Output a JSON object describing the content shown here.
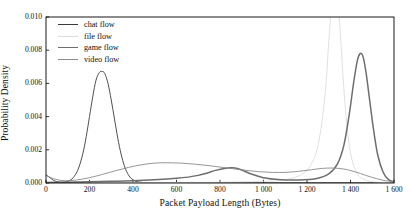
{
  "chart_data": {
    "type": "line",
    "title": "",
    "xlabel": "Packet Payload Length (Bytes)",
    "ylabel": "Probability Density",
    "xlim": [
      0,
      1600
    ],
    "ylim": [
      0.0,
      0.01
    ],
    "xticks": [
      "0",
      "200",
      "400",
      "600",
      "800",
      "1 000",
      "1 200",
      "1 400",
      "1 600"
    ],
    "xtick_values": [
      0,
      200,
      400,
      600,
      800,
      1000,
      1200,
      1400,
      1600
    ],
    "yticks": [
      "0.000",
      "0.002",
      "0.004",
      "0.006",
      "0.008",
      "0.010"
    ],
    "ytick_values": [
      0.0,
      0.002,
      0.004,
      0.006,
      0.008,
      0.01
    ],
    "grid": false,
    "legend_position": "upper left",
    "series": [
      {
        "name": "chat flow",
        "color": "#3b3b3b",
        "width": 0.9,
        "x": [
          0,
          10,
          20,
          35,
          50,
          70,
          90,
          110,
          130,
          150,
          170,
          185,
          200,
          215,
          230,
          245,
          258,
          270,
          285,
          300,
          315,
          330,
          345,
          360,
          375,
          390,
          410,
          430,
          460,
          500,
          560,
          640,
          760,
          900,
          1100,
          1300,
          1450,
          1600
        ],
        "y": [
          0.00048,
          0.0004,
          0.0003,
          0.00016,
          8e-05,
          4e-05,
          6e-05,
          0.00016,
          0.0004,
          0.0009,
          0.0018,
          0.0028,
          0.004,
          0.0052,
          0.0062,
          0.00665,
          0.00672,
          0.0066,
          0.006,
          0.005,
          0.00385,
          0.0027,
          0.00175,
          0.00105,
          0.00058,
          0.0003,
          0.00012,
          5e-05,
          2e-05,
          1e-05,
          1e-05,
          1e-05,
          1e-05,
          1e-05,
          1e-05,
          1e-05,
          1e-05,
          1e-05
        ]
      },
      {
        "name": "file flow",
        "color": "#dcdcdc",
        "width": 0.9,
        "x": [
          0,
          200,
          500,
          800,
          1000,
          1100,
          1180,
          1230,
          1260,
          1285,
          1300,
          1312,
          1322,
          1330,
          1338,
          1348,
          1360,
          1375,
          1395,
          1420,
          1450,
          1500,
          1560,
          1600
        ],
        "y": [
          2e-05,
          2e-05,
          3e-05,
          5e-05,
          0.0001,
          0.0002,
          0.00055,
          0.0014,
          0.0029,
          0.0056,
          0.0085,
          0.0106,
          0.0114,
          0.0116,
          0.0113,
          0.01,
          0.0076,
          0.0047,
          0.0022,
          0.00085,
          0.0003,
          8e-05,
          3e-05,
          2e-05
        ]
      },
      {
        "name": "game flow",
        "color": "#6e6e6e",
        "width": 1.5,
        "x": [
          0,
          60,
          150,
          300,
          450,
          600,
          700,
          780,
          820,
          850,
          870,
          900,
          940,
          1000,
          1080,
          1160,
          1240,
          1300,
          1340,
          1370,
          1395,
          1415,
          1432,
          1445,
          1458,
          1472,
          1488,
          1505,
          1525,
          1550,
          1575,
          1600
        ],
        "y": [
          3e-05,
          4e-05,
          6e-05,
          0.0001,
          0.00016,
          0.00028,
          0.00046,
          0.00076,
          0.00088,
          0.00092,
          0.0009,
          0.00078,
          0.00056,
          0.00032,
          0.0002,
          0.00018,
          0.00026,
          0.00055,
          0.00115,
          0.0023,
          0.0042,
          0.0061,
          0.0074,
          0.0078,
          0.0076,
          0.0066,
          0.005,
          0.0033,
          0.0017,
          0.00065,
          0.0002,
          8e-05
        ]
      },
      {
        "name": "video flow",
        "color": "#8a8a8a",
        "width": 0.9,
        "x": [
          0,
          20,
          50,
          90,
          140,
          200,
          260,
          320,
          380,
          440,
          500,
          560,
          620,
          680,
          740,
          800,
          860,
          920,
          980,
          1040,
          1100,
          1160,
          1220,
          1270,
          1320,
          1370,
          1420,
          1470,
          1520,
          1560,
          1600
        ],
        "y": [
          0.00046,
          0.00034,
          0.0002,
          0.00014,
          0.00018,
          0.00032,
          0.00052,
          0.00074,
          0.00094,
          0.0011,
          0.0012,
          0.00122,
          0.0012,
          0.00114,
          0.00106,
          0.00096,
          0.00086,
          0.00076,
          0.00068,
          0.00064,
          0.00064,
          0.0007,
          0.0008,
          0.00088,
          0.0009,
          0.00084,
          0.00068,
          0.00046,
          0.00026,
          0.00014,
          8e-05
        ]
      }
    ]
  },
  "legend": {
    "items": [
      {
        "label": "chat flow"
      },
      {
        "label": "file flow"
      },
      {
        "label": "game flow"
      },
      {
        "label": "video flow"
      }
    ]
  },
  "axes": {
    "frame_color": "#000000",
    "background": "#ffffff"
  }
}
